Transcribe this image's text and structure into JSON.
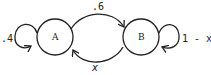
{
  "diagram": {
    "type": "markov-chain",
    "nodes": [
      {
        "id": "A",
        "label": "A"
      },
      {
        "id": "B",
        "label": "B"
      }
    ],
    "edges": [
      {
        "from": "A",
        "to": "A",
        "label": ".4"
      },
      {
        "from": "A",
        "to": "B",
        "label": ".6"
      },
      {
        "from": "B",
        "to": "A",
        "label": "x"
      },
      {
        "from": "B",
        "to": "B",
        "label": "1 - x"
      }
    ],
    "colors": {
      "stroke": "#222222",
      "background": "#ffffff"
    }
  }
}
